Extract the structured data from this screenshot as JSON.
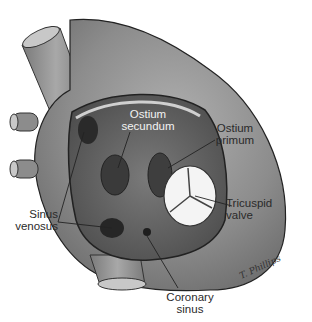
{
  "figure": {
    "labels": {
      "ostium_secundum": [
        "Ostium",
        "secundum"
      ],
      "ostium_primum": [
        "Ostium",
        "primum"
      ],
      "tricuspid_valve": [
        "Tricuspid",
        "valve"
      ],
      "sinus_venosus": [
        "Sinus",
        "venosus"
      ],
      "coronary_sinus": [
        "Coronary",
        "sinus"
      ]
    },
    "signature": "T. Phillips",
    "colors": {
      "heart_fill": "#8a8a8a",
      "heart_dark": "#5a5a5a",
      "atrium_interior": "#6e6e6e",
      "valve": "#f4f4f4",
      "background": "#ffffff"
    }
  }
}
